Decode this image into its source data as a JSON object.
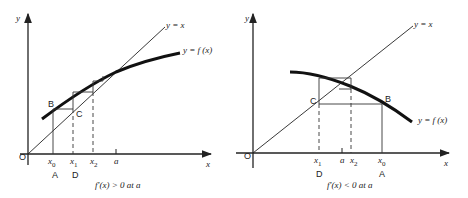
{
  "left": {
    "axis_x": "x",
    "axis_y": "y",
    "origin": "O",
    "line_label": "y = x",
    "curve_label": "y = f (x)",
    "point_b": "B",
    "point_c": "C",
    "ticks": [
      "x0",
      "x1",
      "x2",
      "a"
    ],
    "tick_x0": "x",
    "tick_x0_sub": "0",
    "tick_x1": "x",
    "tick_x1_sub": "1",
    "tick_x2": "x",
    "tick_x2_sub": "2",
    "tick_a": "a",
    "under_x0": "A",
    "under_x1": "D",
    "caption": "f′(x) > 0 at a"
  },
  "right": {
    "axis_x": "x",
    "axis_y": "y",
    "origin": "O",
    "line_label": "y = x",
    "curve_label": "y = f (x)",
    "point_b": "B",
    "point_c": "C",
    "tick_x1": "x",
    "tick_x1_sub": "1",
    "tick_a": "a",
    "tick_x2": "x",
    "tick_x2_sub": "2",
    "tick_x0": "x",
    "tick_x0_sub": "0",
    "under_x1": "D",
    "under_x0": "A",
    "caption": "f′(x) < 0 at a"
  }
}
